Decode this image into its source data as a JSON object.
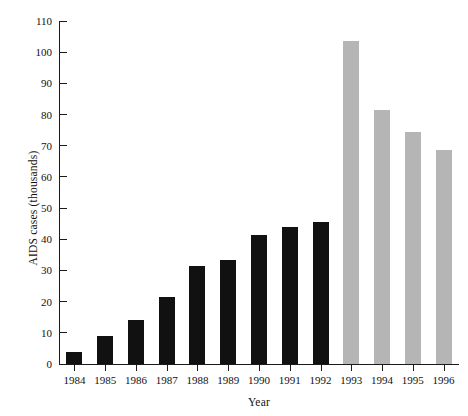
{
  "chart_data": {
    "type": "bar",
    "title": "",
    "subtitle": "",
    "xlabel": "Year",
    "ylabel": "AIDS cases (thousands)",
    "categories": [
      "1984",
      "1985",
      "1986",
      "1987",
      "1988",
      "1989",
      "1990",
      "1991",
      "1992",
      "1993",
      "1994",
      "1995",
      "1996"
    ],
    "values": [
      4,
      9,
      14,
      21.5,
      31.5,
      33.5,
      41.5,
      44,
      45.5,
      103.5,
      81.5,
      74.5,
      68.5
    ],
    "series": [
      {
        "name": "Reported AIDS cases",
        "values": [
          4,
          9,
          14,
          21.5,
          31.5,
          33.5,
          41.5,
          44,
          45.5,
          103.5,
          81.5,
          74.5,
          68.5
        ]
      }
    ],
    "bar_colors": [
      "#111111",
      "#111111",
      "#111111",
      "#111111",
      "#111111",
      "#111111",
      "#111111",
      "#111111",
      "#111111",
      "#b5b5b5",
      "#b5b5b5",
      "#b5b5b5",
      "#b5b5b5"
    ],
    "ylim": [
      0,
      110
    ],
    "ytick_values": [
      0,
      10,
      20,
      30,
      40,
      50,
      60,
      70,
      80,
      90,
      100,
      110
    ],
    "ytick_labels": [
      "0",
      "10",
      "20",
      "30",
      "40",
      "50",
      "60",
      "70",
      "80",
      "90",
      "100",
      "110"
    ],
    "xtick_labels": [
      "1984",
      "1985",
      "1986",
      "1987",
      "1988",
      "1989",
      "1990",
      "1991",
      "1992",
      "1993",
      "1994",
      "1995",
      "1996"
    ],
    "grid": false,
    "legend": false,
    "legend_position": "none",
    "annotations": []
  },
  "colors": {
    "observed_bar": "#111111",
    "projected_bar": "#b5b5b5",
    "axis": "#1a1a1a",
    "text": "#111111",
    "background": "#ffffff"
  }
}
